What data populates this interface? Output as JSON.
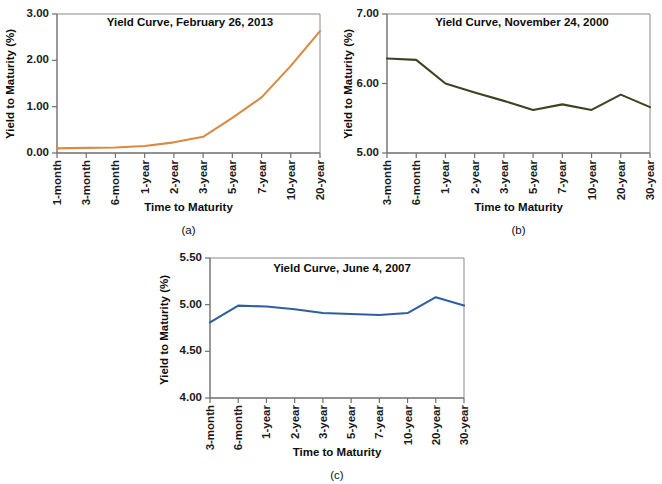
{
  "figure": {
    "background_color": "#ffffff"
  },
  "panels": [
    {
      "id": "panel-a",
      "caption": "(a)",
      "title": "Yield Curve, February 26, 2013",
      "ylabel": "Yield to Maturity (%)",
      "xlabel": "Time to Maturity",
      "line_color": "#d98a43",
      "chart_data": {
        "type": "line",
        "title": "Yield Curve, February 26, 2013",
        "xlabel": "Time to Maturity",
        "ylabel": "Yield to Maturity (%)",
        "ylim": [
          0.0,
          3.0
        ],
        "yticks": [
          0.0,
          1.0,
          2.0,
          3.0
        ],
        "ytick_labels": [
          "0.00",
          "1.00",
          "2.00",
          "3.00"
        ],
        "grid": false,
        "legend": "none",
        "categories": [
          "1-month",
          "3-month",
          "6-month",
          "1-year",
          "2-year",
          "3-year",
          "5-year",
          "7-year",
          "10-year",
          "20-year"
        ],
        "values": [
          0.1,
          0.11,
          0.12,
          0.15,
          0.23,
          0.35,
          0.76,
          1.2,
          1.88,
          2.63
        ]
      }
    },
    {
      "id": "panel-b",
      "caption": "(b)",
      "title": "Yield Curve, November 24, 2000",
      "ylabel": "Yield to Maturity (%)",
      "xlabel": "Time to Maturity",
      "line_color": "#3c4423",
      "chart_data": {
        "type": "line",
        "title": "Yield Curve, November 24, 2000",
        "xlabel": "Time to Maturity",
        "ylabel": "Yield to Maturity (%)",
        "ylim": [
          5.0,
          7.0
        ],
        "yticks": [
          5.0,
          6.0,
          7.0
        ],
        "ytick_labels": [
          "5.00",
          "6.00",
          "7.00"
        ],
        "grid": false,
        "legend": "none",
        "categories": [
          "3-month",
          "6-month",
          "1-year",
          "2-year",
          "3-year",
          "5-year",
          "7-year",
          "10-year",
          "20-year",
          "30-year"
        ],
        "values": [
          6.36,
          6.34,
          6.0,
          5.87,
          5.75,
          5.62,
          5.7,
          5.62,
          5.84,
          5.66
        ]
      }
    },
    {
      "id": "panel-c",
      "caption": "(c)",
      "title": "Yield Curve, June 4, 2007",
      "ylabel": "Yield to Maturity (%)",
      "xlabel": "Time to Maturity",
      "line_color": "#2f5fa3",
      "chart_data": {
        "type": "line",
        "title": "Yield Curve, June 4, 2007",
        "xlabel": "Time to Maturity",
        "ylabel": "Yield to Maturity (%)",
        "ylim": [
          4.0,
          5.5
        ],
        "yticks": [
          4.0,
          4.5,
          5.0,
          5.5
        ],
        "ytick_labels": [
          "4.00",
          "4.50",
          "5.00",
          "5.50"
        ],
        "grid": false,
        "legend": "none",
        "categories": [
          "3-month",
          "6-month",
          "1-year",
          "2-year",
          "3-year",
          "5-year",
          "7-year",
          "10-year",
          "20-year",
          "30-year"
        ],
        "values": [
          4.81,
          4.99,
          4.98,
          4.95,
          4.91,
          4.9,
          4.89,
          4.91,
          5.08,
          4.99
        ]
      }
    }
  ]
}
